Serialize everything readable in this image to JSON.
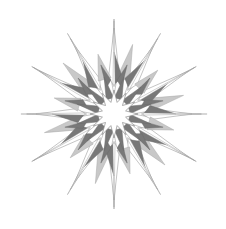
{
  "figure": {
    "type": "vector-illustration",
    "canvas": {
      "width": 226,
      "height": 229,
      "background": "#ffffff"
    },
    "center": {
      "x": 114,
      "y": 114
    },
    "symmetry": {
      "fold": 12,
      "angle_step_deg": 30,
      "phase_deg": -90
    },
    "palette": {
      "background": "#ffffff",
      "white": "#ffffff",
      "light_gray": "#c8c8c8",
      "mid_gray": "#a8a8a8",
      "dark_gray": "#787878",
      "darkest_gray": "#6a6a6a",
      "outline": "#8a8a8a",
      "hairline": "#9a9a9a"
    },
    "geometry": {
      "inner_star_outer_radius": 24,
      "inner_star_inner_radius": 12,
      "ring_radius": 38,
      "mid_wedge_radius": 62,
      "long_spike_radius": 95,
      "short_spike_radius": 72,
      "wedge_half_width_deg": 13,
      "spike_half_width_deg": 4.5
    },
    "layers": [
      {
        "name": "long-spikes",
        "count": 12,
        "fill": "#ffffff",
        "stroke": "#9a9a9a",
        "radius": 95
      },
      {
        "name": "dark-wedges",
        "count": 12,
        "fill": "#787878",
        "stroke": "#6a6a6a",
        "radius": 62
      },
      {
        "name": "light-wedges",
        "count": 12,
        "fill": "#c8c8c8",
        "stroke": "#a8a8a8",
        "radius": 72
      },
      {
        "name": "white-wedges",
        "count": 12,
        "fill": "#ffffff",
        "stroke": "#8a8a8a",
        "radius": 86
      },
      {
        "name": "inner-ring-triangles",
        "count": 12,
        "fill": "#787878",
        "stroke": "#6a6a6a",
        "radius": 38
      },
      {
        "name": "inner-star",
        "points": 12,
        "fill": "#ffffff",
        "stroke": "#8a8a8a",
        "radius": 24
      }
    ]
  },
  "labels": {
    "figure_caption": "",
    "alt_text": "Grayscale twelve-fold symmetric star burst with layered triangular rays"
  }
}
